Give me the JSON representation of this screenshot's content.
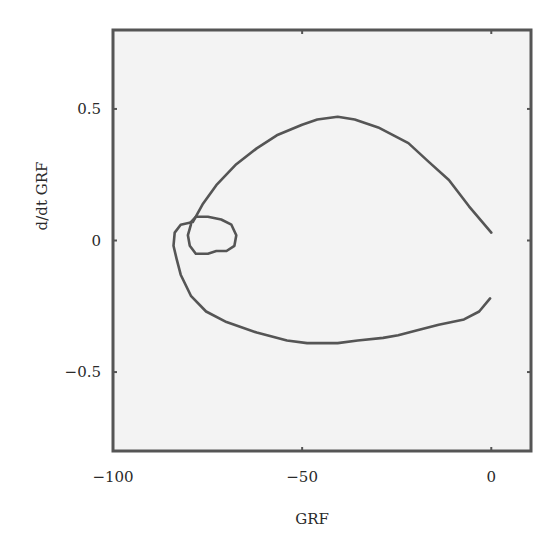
{
  "chart_data": {
    "type": "line",
    "title": "",
    "xlabel": "GRF",
    "ylabel": "d/dt GRF",
    "xlim": [
      -100,
      10.5
    ],
    "ylim": [
      -0.8,
      0.8
    ],
    "xticks": [
      -100,
      -50,
      0
    ],
    "xtick_labels": [
      "−100",
      "−50",
      "0"
    ],
    "yticks": [
      -0.5,
      0,
      0.5
    ],
    "ytick_labels": [
      "−0.5",
      "0",
      "0.5"
    ],
    "grid": false,
    "legend": null,
    "series": [
      {
        "name": "phase-portrait-outer",
        "x": [
          0,
          -5.9,
          -11.2,
          -16.6,
          -21.9,
          -29.9,
          -36.1,
          -40.6,
          -46,
          -50,
          -56.7,
          -62,
          -67.4,
          -72.7,
          -76.2,
          -78.9,
          -82.1,
          -83.7,
          -84,
          -83.2,
          -82.1,
          -79.4,
          -75.4,
          -70,
          -62,
          -54,
          -48.7,
          -40.6,
          -35.3,
          -28.6,
          -24.6,
          -19.3,
          -13.9,
          -7.2,
          -3.2,
          -0.3
        ],
        "y": [
          0.03,
          0.13,
          0.23,
          0.3,
          0.37,
          0.43,
          0.46,
          0.47,
          0.46,
          0.44,
          0.4,
          0.35,
          0.29,
          0.21,
          0.14,
          0.07,
          0.06,
          0.03,
          -0.02,
          -0.07,
          -0.13,
          -0.21,
          -0.27,
          -0.31,
          -0.35,
          -0.38,
          -0.39,
          -0.39,
          -0.38,
          -0.37,
          -0.36,
          -0.34,
          -0.32,
          -0.3,
          -0.27,
          -0.22
        ]
      },
      {
        "name": "phase-portrait-inner-loop",
        "x": [
          -79.4,
          -78.1,
          -74.9,
          -71.4,
          -68.7,
          -67.4,
          -67.9,
          -70,
          -72.7,
          -74.9,
          -78.1,
          -79.7,
          -80.2,
          -79.4
        ],
        "y": [
          0.07,
          0.09,
          0.09,
          0.08,
          0.06,
          0.02,
          -0.02,
          -0.04,
          -0.04,
          -0.05,
          -0.05,
          -0.02,
          0.02,
          0.06
        ]
      }
    ]
  },
  "style": {
    "plot_bg": "#f3f3f3",
    "frame_color": "#555555",
    "line_color": "#555555"
  }
}
